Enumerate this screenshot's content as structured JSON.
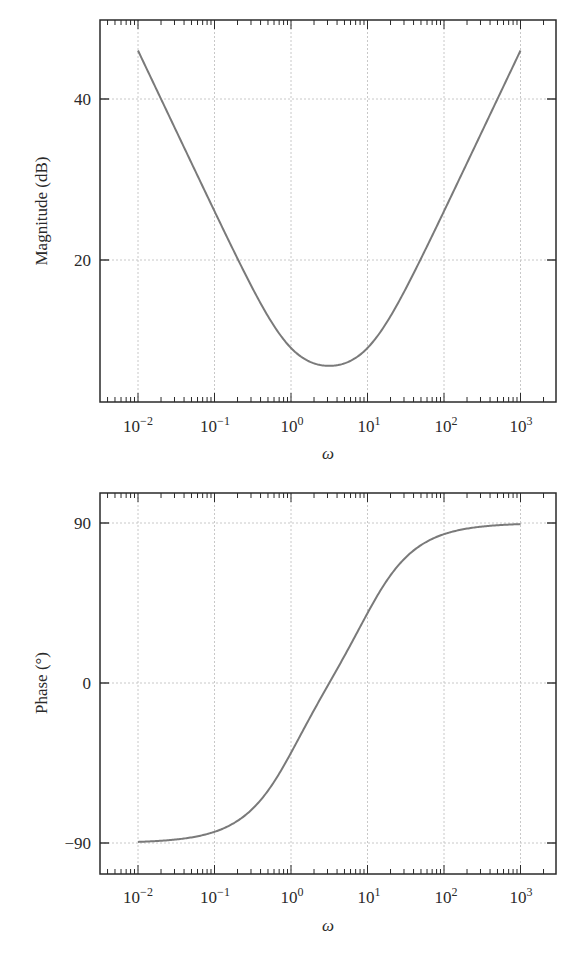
{
  "chart_data": [
    {
      "type": "line",
      "title": "",
      "xlabel": "ω",
      "ylabel": "Magnitude (dB)",
      "xscale": "log",
      "xlim": [
        0.00316,
        3162
      ],
      "ylim": [
        2.5,
        50
      ],
      "grid": true,
      "x_tick_labels": [
        "10^-2",
        "10^-1",
        "10^0",
        "10^1",
        "10^2",
        "10^3"
      ],
      "y_tick_labels": [
        "20",
        "40"
      ],
      "y_ticks": [
        20,
        40
      ],
      "series": [
        {
          "name": "magnitude",
          "x": [
            0.01,
            0.02,
            0.05,
            0.1,
            0.2,
            0.5,
            1,
            2,
            3.16,
            5,
            10,
            20,
            50,
            100,
            200,
            500,
            1000
          ],
          "values": [
            46.0,
            40.0,
            32.1,
            26.1,
            20.2,
            12.8,
            9.1,
            7.2,
            6.9,
            7.4,
            9.4,
            13.1,
            20.3,
            26.1,
            32.1,
            40.0,
            46.0
          ]
        }
      ]
    },
    {
      "type": "line",
      "title": "",
      "xlabel": "ω",
      "ylabel": "Phase (°)",
      "xscale": "log",
      "xlim": [
        0.00316,
        3162
      ],
      "ylim": [
        -109,
        109
      ],
      "grid": true,
      "x_tick_labels": [
        "10^-2",
        "10^-1",
        "10^0",
        "10^1",
        "10^2",
        "10^3"
      ],
      "y_tick_labels": [
        "-90",
        "0",
        "90"
      ],
      "y_ticks": [
        -90,
        0,
        90
      ],
      "series": [
        {
          "name": "phase",
          "x": [
            0.01,
            0.02,
            0.05,
            0.1,
            0.2,
            0.5,
            1,
            2,
            3.16,
            5,
            10,
            20,
            50,
            100,
            200,
            500,
            1000
          ],
          "values": [
            -89.4,
            -88.7,
            -86.9,
            -83.7,
            -77.5,
            -60.6,
            -39.3,
            -15.2,
            0.0,
            15.2,
            39.3,
            60.6,
            77.5,
            83.7,
            86.9,
            88.7,
            89.4
          ]
        }
      ]
    }
  ],
  "labels": {
    "mag_ylabel": "Magnitude (dB)",
    "phase_ylabel": "Phase (°)",
    "xlabel": "ω",
    "x_base": "10",
    "x_exps": [
      "−2",
      "−1",
      "0",
      "1",
      "2",
      "3"
    ],
    "mag_yticks": [
      "40",
      "20"
    ],
    "phase_yticks": [
      "90",
      "0",
      "−90"
    ]
  },
  "colors": {
    "curve": "#7a7a7a",
    "axes": "#2a2a2a",
    "grid": "#c8c8c8"
  }
}
